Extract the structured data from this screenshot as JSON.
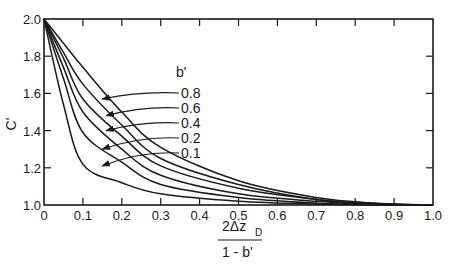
{
  "chart_data": {
    "type": "line",
    "title": "",
    "xlabel": "2Δz_D / (1 - b')",
    "xlabel_numerator": "2Δz",
    "xlabel_subscript": "D",
    "xlabel_denominator": "1 - b'",
    "ylabel": "C'",
    "xlim": [
      0,
      1.0
    ],
    "ylim": [
      1.0,
      2.0
    ],
    "grid": false,
    "x_ticks": [
      "0",
      "0.1",
      "0.2",
      "0.3",
      "0.4",
      "0.5",
      "0.6",
      "0.7",
      "0.8",
      "0.9",
      "1.0"
    ],
    "y_ticks": [
      "1.0",
      "1.2",
      "1.4",
      "1.6",
      "1.8",
      "2.0"
    ],
    "legend_title": "b'",
    "legend_position": "inside, upper-middle with arrows pointing to curves",
    "x": [
      0,
      0.05,
      0.1,
      0.2,
      0.3,
      0.5,
      0.7,
      0.85,
      1.0
    ],
    "series": [
      {
        "name": "0.8",
        "values": [
          2.0,
          1.87,
          1.74,
          1.5,
          1.31,
          1.13,
          1.04,
          1.01,
          1.0
        ]
      },
      {
        "name": "0.6",
        "values": [
          2.0,
          1.82,
          1.65,
          1.43,
          1.25,
          1.11,
          1.03,
          1.01,
          1.0
        ]
      },
      {
        "name": "0.4",
        "values": [
          2.0,
          1.79,
          1.57,
          1.37,
          1.21,
          1.09,
          1.03,
          1.005,
          1.0
        ]
      },
      {
        "name": "0.2",
        "values": [
          2.0,
          1.74,
          1.5,
          1.3,
          1.16,
          1.06,
          1.02,
          1.003,
          1.0
        ]
      },
      {
        "name": "0.1",
        "values": [
          2.0,
          1.68,
          1.39,
          1.23,
          1.11,
          1.04,
          1.01,
          1.002,
          1.0
        ]
      },
      {
        "name": "",
        "values": [
          2.0,
          1.54,
          1.22,
          1.12,
          1.06,
          1.02,
          1.005,
          1.001,
          1.0
        ]
      }
    ],
    "arrow_targets": [
      {
        "label": "0.8",
        "x": 0.15,
        "y": 1.57
      },
      {
        "label": "0.6",
        "x": 0.16,
        "y": 1.48
      },
      {
        "label": "0.4",
        "x": 0.16,
        "y": 1.4
      },
      {
        "label": "0.2",
        "x": 0.15,
        "y": 1.3
      },
      {
        "label": "0.1",
        "x": 0.15,
        "y": 1.21
      }
    ]
  }
}
